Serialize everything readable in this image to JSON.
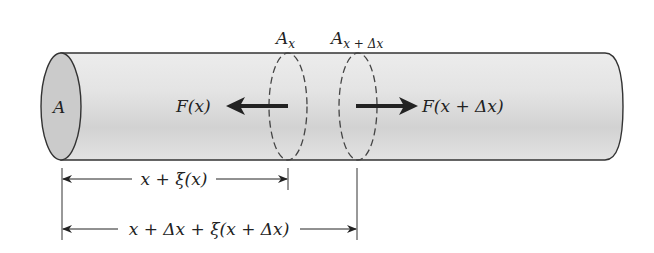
{
  "diagram": {
    "type": "cylindrical-rod-strain",
    "end_face_label": "A",
    "sections": [
      {
        "id": "section-x",
        "label_base": "A",
        "label_sub": "x"
      },
      {
        "id": "section-x-dx",
        "label_base": "A",
        "label_sub": "x + Δx"
      }
    ],
    "forces": [
      {
        "id": "force-left",
        "label": "F(x)",
        "direction": "left"
      },
      {
        "id": "force-right",
        "label": "F(x + Δx)",
        "direction": "right"
      }
    ],
    "dimensions": [
      {
        "id": "dim-1",
        "label": "x + ξ(x)"
      },
      {
        "id": "dim-2",
        "label": "x + Δx + ξ(x + Δx)"
      }
    ],
    "colors": {
      "rod_fill": "#e6e6e6",
      "rod_shade": "#cfcfcf",
      "end_face_fill": "#cccccc",
      "stroke": "#333333"
    }
  }
}
